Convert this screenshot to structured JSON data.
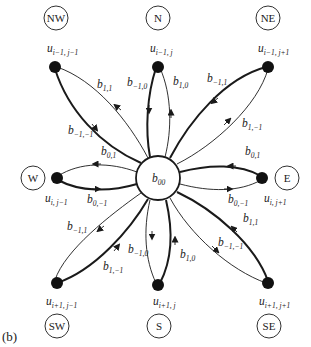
{
  "panel_label": "(b)",
  "center": {
    "label_base": "b",
    "label_sub": "00"
  },
  "directions": {
    "NW": "NW",
    "N": "N",
    "NE": "NE",
    "W": "W",
    "E": "E",
    "SW": "SW",
    "S": "S",
    "SE": "SE"
  },
  "nodes": {
    "NW": {
      "base": "u",
      "sub": "i−1, j−1"
    },
    "N": {
      "base": "u",
      "sub": "i−1, j"
    },
    "NE": {
      "base": "u",
      "sub": "i−1, j+1"
    },
    "W": {
      "base": "u",
      "sub": "i, j−1"
    },
    "E": {
      "base": "u",
      "sub": "i, j+1"
    },
    "SW": {
      "base": "u",
      "sub": "i+1, j−1"
    },
    "S": {
      "base": "u",
      "sub": "i+1, j"
    },
    "SE": {
      "base": "u",
      "sub": "i+1, j+1"
    }
  },
  "edges": {
    "NW_in": {
      "base": "b",
      "sub": "1,1"
    },
    "NW_out": {
      "base": "b",
      "sub": "−1,−1"
    },
    "N_out": {
      "base": "b",
      "sub": "−1,0"
    },
    "N_in": {
      "base": "b",
      "sub": "1,0"
    },
    "NE_out": {
      "base": "b",
      "sub": "−1,1"
    },
    "NE_in": {
      "base": "b",
      "sub": "1,−1"
    },
    "W_in": {
      "base": "b",
      "sub": "0,1"
    },
    "W_out": {
      "base": "b",
      "sub": "0,−1"
    },
    "E_in": {
      "base": "b",
      "sub": "0,1"
    },
    "E_out": {
      "base": "b",
      "sub": "0,−1"
    },
    "SW_out": {
      "base": "b",
      "sub": "−1,1"
    },
    "SW_in": {
      "base": "b",
      "sub": "1,−1"
    },
    "S_out": {
      "base": "b",
      "sub": "−1,0"
    },
    "S_in": {
      "base": "b",
      "sub": "1,0"
    },
    "SE_in": {
      "base": "b",
      "sub": "1,1"
    },
    "SE_out": {
      "base": "b",
      "sub": "−1,−1"
    }
  },
  "colors": {
    "ink": "#1a1a1a",
    "background": "#ffffff"
  }
}
